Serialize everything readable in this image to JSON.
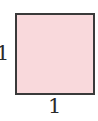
{
  "diagram": {
    "shape": "square",
    "fill_color": "#f9d9dc",
    "stroke_color": "#3a3a3a",
    "side_label_left": "1",
    "side_label_bottom": "1"
  }
}
